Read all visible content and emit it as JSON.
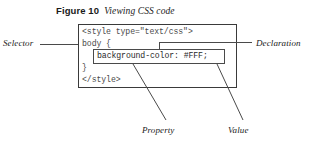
{
  "figure": {
    "number_label": "Figure 10",
    "title": "Viewing CSS code"
  },
  "code_block": {
    "language": "css",
    "lines": [
      "<style type=\"text/css\">",
      "body {",
      "background-color: #FFF;",
      "}",
      "</style>"
    ],
    "highlighted_line": "background-color: #FFF;"
  },
  "annotations": {
    "selector": "Selector",
    "declaration": "Declaration",
    "property": "Property",
    "value": "Value"
  },
  "colors": {
    "ink": "#1a1a1a",
    "code_text": "#4a4a4a",
    "rule": "#3a3a3a",
    "page_background": "#ffffff"
  }
}
